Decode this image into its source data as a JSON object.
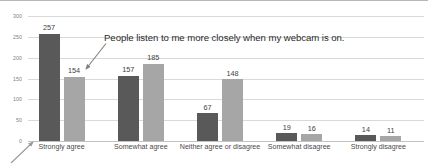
{
  "chart_data": {
    "type": "bar",
    "title": "",
    "subtitle": "",
    "xlabel": "",
    "ylabel": "",
    "ylim": [
      0,
      300
    ],
    "y_ticks": [
      0,
      50,
      100,
      150,
      200,
      250,
      300
    ],
    "grid": true,
    "legend_position": "none",
    "categories": [
      "Strongly agree",
      "Somewhat agree",
      "Neither agree or disagree",
      "Somewhat disagree",
      "Strongly disagree"
    ],
    "series": [
      {
        "name": "Series 1",
        "color": "#595959",
        "values": [
          257,
          157,
          67,
          19,
          14
        ]
      },
      {
        "name": "Series 2",
        "color": "#a6a6a6",
        "values": [
          154,
          185,
          148,
          16,
          11
        ]
      }
    ],
    "annotations": [
      {
        "name": "webcam-callout",
        "text": "People listen to me more closely when my webcam is on.",
        "points_to": "Strongly agree / Series 2 (154)"
      },
      {
        "name": "origin-callout",
        "text": "",
        "points_to": "x-axis origin near Strongly agree"
      }
    ]
  },
  "colors": {
    "series_dark": "#595959",
    "series_light": "#a6a6a6",
    "gridline": "#d9d9d9",
    "axis": "#c3c3c3",
    "tick_text": "#7d7d7d",
    "category_text": "#4a4a4a",
    "value_text": "#3f3f3f",
    "annotation_text": "#2b2b2b",
    "arrow": "#808080",
    "background": "#ffffff"
  }
}
